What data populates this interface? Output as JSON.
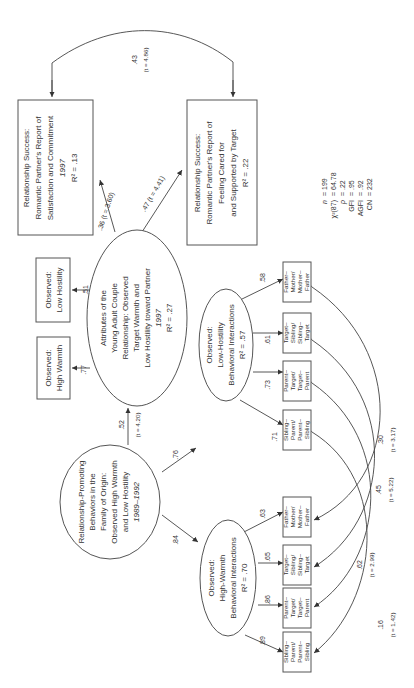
{
  "nodes": {
    "family_origin": {
      "lines": [
        "Relationship-Promoting",
        "Behaviors in the",
        "Family of Origin:",
        "Observed High Warmth",
        "and Low Hostility",
        "1989–1992"
      ]
    },
    "couple_attributes": {
      "lines": [
        "Attributes of the",
        "Young Adult Couple",
        "Relationship: Observed",
        "Target Warmth and",
        "Low Hostility toward Partner",
        "1997",
        "R² = .27"
      ]
    },
    "satisfaction": {
      "lines": [
        "Relationship Success:",
        "Romantic Partner's Report of",
        "Satisfaction and Commitment",
        "1997",
        "R² = .13"
      ]
    },
    "cared_for": {
      "lines": [
        "Relationship Success:",
        "Romantic Partner's Report of",
        "Feeling Cared for",
        "and Supported by Target",
        "R² = .22"
      ]
    },
    "obs_low_hostility": {
      "lines": [
        "Observed:",
        "Low Hostility"
      ]
    },
    "obs_high_warmth": {
      "lines": [
        "Observed:",
        "High Warmth"
      ]
    },
    "low_hostility_interactions": {
      "lines": [
        "Observed:",
        "Low-Hostility",
        "Behavioral Interactions",
        "R² = .57"
      ]
    },
    "high_warmth_interactions": {
      "lines": [
        "Observed:",
        "High-Warmth",
        "Behavioral Interactions",
        "R² = .70"
      ]
    },
    "indicators_low_hostility": [
      {
        "lines": [
          "Sibling–",
          "Parent/",
          "Parent–",
          "Sibling"
        ],
        "loading": ".71"
      },
      {
        "lines": [
          "Parent–",
          "Target/",
          "Target–",
          "Parent"
        ],
        "loading": ".73"
      },
      {
        "lines": [
          "Target–",
          "Sibling/",
          "Sibling–",
          "Target"
        ],
        "loading": ".61"
      },
      {
        "lines": [
          "Father–",
          "Mother/",
          "Mother–",
          "Father"
        ],
        "loading": ".58"
      }
    ],
    "indicators_high_warmth": [
      {
        "lines": [
          "Sibling–",
          "Parent/",
          "Parent–",
          "Sibling"
        ],
        "loading": ".89"
      },
      {
        "lines": [
          "Parent–",
          "Target/",
          "Target–",
          "Parent"
        ],
        "loading": ".86"
      },
      {
        "lines": [
          "Target–",
          "Sibling/",
          "Sibling–",
          "Target"
        ],
        "loading": ".65"
      },
      {
        "lines": [
          "Father–",
          "Mother/",
          "Mother–",
          "Father"
        ],
        "loading": ".63"
      }
    ]
  },
  "paths": {
    "family_to_couple": {
      "coef": ".52",
      "t": "(t = 4.20)"
    },
    "couple_to_satisfaction": {
      "label": ".36 (t = 3.60)"
    },
    "couple_to_cared": {
      "label": ".47 (t = 4.41)"
    },
    "couple_to_low_hostility": ".51",
    "couple_to_high_warmth": ".77",
    "family_to_low_hostility_int": ".76",
    "family_to_high_warmth_int": ".84",
    "satisfaction_cared_covariance": {
      "coef": ".43",
      "t": "(t = 4.86)"
    }
  },
  "residual_correlations": [
    {
      "coef": ".16",
      "t": "(t = 1.42)"
    },
    {
      "coef": ".62",
      "t": "(t = 2.99)"
    },
    {
      "coef": ".45",
      "t": "(t = 5.22)"
    },
    {
      "coef": ".30",
      "t": "(t = 3.17)"
    }
  ],
  "fit_stats": [
    {
      "label": "n",
      "value": "= 199"
    },
    {
      "label": "χ²(87)",
      "value": "= 64.78"
    },
    {
      "label": "p",
      "value": "= .22"
    },
    {
      "label": "GFI",
      "value": "= .95"
    },
    {
      "label": "AGFI",
      "value": "= .92"
    },
    {
      "label": "CN",
      "value": "= 232"
    }
  ]
}
